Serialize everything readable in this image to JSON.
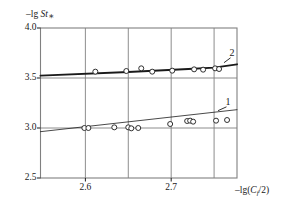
{
  "figure": {
    "width": 297,
    "height": 209,
    "background": "#ffffff",
    "ink_color": "#1a1a1a",
    "grid_color": "#808080"
  },
  "axes": {
    "y_axis_label": "–lg St",
    "y_axis_label_sub": "∗",
    "x_axis_label_prefix": "–lg(",
    "x_axis_label_italic": "C",
    "x_axis_label_sub": "f",
    "x_axis_label_suffix": "/2)",
    "y_ticks": [
      "4.0",
      "3.5",
      "3.0",
      "2.5"
    ],
    "x_ticks": [
      "2.6",
      "2.7"
    ]
  },
  "labels": {
    "curve1": "1",
    "curve2": "2"
  },
  "chart_data": {
    "type": "scatter",
    "title": "",
    "subtitle": "",
    "xlabel": "–lg(C_f/2)",
    "ylabel": "–lg St∗",
    "xlim": [
      2.5477,
      2.7767
    ],
    "ylim": [
      2.5,
      4.0
    ],
    "grid": true,
    "grid_x": [
      2.6,
      2.65,
      2.7,
      2.75
    ],
    "grid_y": [
      3.5,
      3.0
    ],
    "x_tick_values": [
      2.6,
      2.7
    ],
    "x_tick_labels": [
      "2.6",
      "2.7"
    ],
    "y_tick_values": [
      4.0,
      3.5,
      3.0,
      2.5
    ],
    "y_tick_labels": [
      "4.0",
      "3.5",
      "3.0",
      "2.5"
    ],
    "legend_position": "inline-annotation",
    "annotations": [
      {
        "text": "1",
        "x": 2.7662,
        "y": 3.2467,
        "leader_to_x": 2.7546,
        "leader_to_y": 3.1733
      },
      {
        "text": "2",
        "x": 2.7709,
        "y": 3.7367,
        "leader_to_x": 2.7616,
        "leader_to_y": 3.6533
      }
    ],
    "series": [
      {
        "name": "1",
        "label": "1",
        "marker": "open-circle",
        "line_style": "solid-thin",
        "line_width": 0.8,
        "fit_line": {
          "x": [
            2.5477,
            2.7767
          ],
          "y": [
            2.9633,
            3.1833
          ]
        },
        "points": [
          {
            "x": 2.5988,
            "y": 3.0
          },
          {
            "x": 2.6035,
            "y": 3.0
          },
          {
            "x": 2.6337,
            "y": 3.0067
          },
          {
            "x": 2.65,
            "y": 3.0067
          },
          {
            "x": 2.6535,
            "y": 2.9967
          },
          {
            "x": 2.6616,
            "y": 3.0
          },
          {
            "x": 2.6988,
            "y": 3.04
          },
          {
            "x": 2.7186,
            "y": 3.07
          },
          {
            "x": 2.7221,
            "y": 3.0733
          },
          {
            "x": 2.7256,
            "y": 3.0633
          },
          {
            "x": 2.7523,
            "y": 3.0733
          },
          {
            "x": 2.7651,
            "y": 3.08
          }
        ]
      },
      {
        "name": "2",
        "label": "2",
        "marker": "open-circle",
        "line_style": "solid-bold",
        "line_width": 1.9,
        "fit_line": {
          "x": [
            2.5477,
            2.65,
            2.72,
            2.75,
            2.7767
          ],
          "y": [
            3.5233,
            3.56,
            3.59,
            3.6033,
            3.6367
          ]
        },
        "points": [
          {
            "x": 2.6116,
            "y": 3.5633
          },
          {
            "x": 2.6477,
            "y": 3.57
          },
          {
            "x": 2.6651,
            "y": 3.5967
          },
          {
            "x": 2.6779,
            "y": 3.5633
          },
          {
            "x": 2.7012,
            "y": 3.5733
          },
          {
            "x": 2.7267,
            "y": 3.5867
          },
          {
            "x": 2.7372,
            "y": 3.5833
          },
          {
            "x": 2.7512,
            "y": 3.5967
          },
          {
            "x": 2.7558,
            "y": 3.59
          }
        ]
      }
    ]
  }
}
